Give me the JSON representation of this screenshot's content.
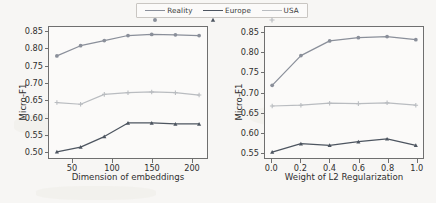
{
  "legend": {
    "position": "top-center",
    "items": [
      {
        "label": "Reality",
        "color": "#8a8f9a",
        "marker": "circle"
      },
      {
        "label": "Europe",
        "color": "#4d5560",
        "marker": "triangle"
      },
      {
        "label": "USA",
        "color": "#b9bcc0",
        "marker": "plus"
      }
    ]
  },
  "chart_data": [
    {
      "id": "left",
      "type": "line",
      "title": "",
      "xlabel": "Dimension of embeddings",
      "ylabel": "Micro-F1",
      "x": [
        30,
        60,
        90,
        120,
        150,
        180,
        210
      ],
      "xlim": [
        20,
        220
      ],
      "ylim": [
        0.48,
        0.865
      ],
      "xticks": [
        50,
        100,
        150,
        200
      ],
      "xticklabels": [
        "50",
        "100",
        "150",
        "200"
      ],
      "yticks": [
        0.5,
        0.55,
        0.6,
        0.65,
        0.7,
        0.75,
        0.8,
        0.85
      ],
      "yticklabels": [
        "0.50",
        "0.55",
        "0.60",
        "0.65",
        "0.70",
        "0.75",
        "0.80",
        "0.85"
      ],
      "grid": false,
      "series": [
        {
          "name": "Reality",
          "color": "#8a8f9a",
          "marker": "circle",
          "values": [
            0.78,
            0.81,
            0.825,
            0.84,
            0.843,
            0.842,
            0.84
          ]
        },
        {
          "name": "Europe",
          "color": "#4d5560",
          "marker": "triangle",
          "values": [
            0.498,
            0.512,
            0.543,
            0.583,
            0.583,
            0.58,
            0.58
          ]
        },
        {
          "name": "USA",
          "color": "#b9bcc0",
          "marker": "plus",
          "values": [
            0.643,
            0.638,
            0.667,
            0.672,
            0.674,
            0.672,
            0.665
          ]
        }
      ]
    },
    {
      "id": "right",
      "type": "line",
      "title": "",
      "xlabel": "Weight of L2 Regularization",
      "ylabel": "Micro-F1",
      "x": [
        0.0,
        0.2,
        0.4,
        0.6,
        0.8,
        1.0
      ],
      "xlim": [
        -0.05,
        1.05
      ],
      "ylim": [
        0.535,
        0.865
      ],
      "xticks": [
        0.0,
        0.2,
        0.4,
        0.6,
        0.8,
        1.0
      ],
      "xticklabels": [
        "0.0",
        "0.2",
        "0.4",
        "0.6",
        "0.8",
        "1.0"
      ],
      "yticks": [
        0.55,
        0.6,
        0.65,
        0.7,
        0.75,
        0.8,
        0.85
      ],
      "yticklabels": [
        "0.55",
        "0.60",
        "0.65",
        "0.70",
        "0.75",
        "0.80",
        "0.85"
      ],
      "grid": false,
      "series": [
        {
          "name": "Reality",
          "color": "#8a8f9a",
          "marker": "circle",
          "values": [
            0.718,
            0.793,
            0.83,
            0.838,
            0.841,
            0.833
          ]
        },
        {
          "name": "Europe",
          "color": "#4d5560",
          "marker": "triangle",
          "values": [
            0.55,
            0.571,
            0.567,
            0.576,
            0.583,
            0.567
          ]
        },
        {
          "name": "USA",
          "color": "#b9bcc0",
          "marker": "plus",
          "values": [
            0.666,
            0.668,
            0.673,
            0.672,
            0.674,
            0.668
          ]
        }
      ]
    }
  ]
}
